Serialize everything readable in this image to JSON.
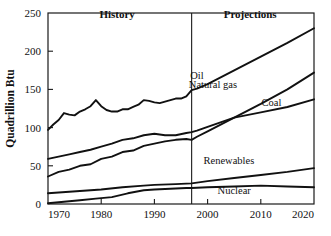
{
  "chart_data": {
    "type": "line",
    "title": "",
    "xlabel": "",
    "ylabel": "Quadrillion Btu",
    "xlim": [
      1970,
      2020
    ],
    "ylim": [
      0,
      250
    ],
    "xticks": [
      1970,
      1980,
      1990,
      2000,
      2010,
      2020
    ],
    "yticks": [
      0,
      50,
      100,
      150,
      200,
      250
    ],
    "grid": false,
    "legend_position": "inline-annotations",
    "annotations": [
      {
        "text": "History",
        "x": 1983,
        "y": 243,
        "bold": true
      },
      {
        "text": "Projections",
        "x": 2008,
        "y": 243,
        "bold": true
      }
    ],
    "divider": {
      "x": 1997,
      "label": "history-projection-divider"
    },
    "series": [
      {
        "name": "Oil",
        "label_x": 1998,
        "label_y": 163,
        "x": [
          1970,
          1971,
          1972,
          1973,
          1974,
          1975,
          1976,
          1977,
          1978,
          1979,
          1980,
          1981,
          1982,
          1983,
          1984,
          1985,
          1986,
          1987,
          1988,
          1989,
          1990,
          1991,
          1992,
          1993,
          1994,
          1995,
          1996,
          1997,
          1998,
          2000,
          2005,
          2010,
          2015,
          2020
        ],
        "values": [
          97,
          104,
          110,
          119,
          117,
          116,
          121,
          124,
          128,
          136,
          128,
          123,
          121,
          121,
          124,
          124,
          127,
          130,
          136,
          135,
          133,
          132,
          134,
          136,
          138,
          138,
          141,
          149,
          151,
          157,
          175,
          193,
          211,
          230
        ]
      },
      {
        "name": "Natural gas",
        "label_x": 2001,
        "label_y": 152,
        "x": [
          1970,
          1972,
          1974,
          1976,
          1978,
          1980,
          1982,
          1984,
          1986,
          1988,
          1990,
          1992,
          1994,
          1996,
          1997,
          1998,
          2000,
          2005,
          2010,
          2015,
          2020
        ],
        "values": [
          36,
          42,
          45,
          50,
          52,
          59,
          62,
          68,
          70,
          76,
          79,
          82,
          84,
          85,
          84,
          88,
          95,
          113,
          131,
          150,
          172
        ]
      },
      {
        "name": "Coal",
        "label_x": 2012,
        "label_y": 128,
        "x": [
          1970,
          1972,
          1974,
          1976,
          1978,
          1980,
          1982,
          1984,
          1986,
          1988,
          1990,
          1992,
          1994,
          1996,
          1997,
          1998,
          2000,
          2005,
          2010,
          2015,
          2020
        ],
        "values": [
          59,
          62,
          65,
          68,
          71,
          75,
          79,
          84,
          86,
          90,
          92,
          90,
          90,
          93,
          94,
          96,
          101,
          113,
          120,
          127,
          137
        ]
      },
      {
        "name": "Renewables",
        "label_x": 2004,
        "label_y": 52,
        "x": [
          1970,
          1974,
          1978,
          1980,
          1984,
          1988,
          1990,
          1994,
          1997,
          2000,
          2005,
          2010,
          2015,
          2020
        ],
        "values": [
          14,
          16,
          18,
          19,
          22,
          24,
          25,
          26,
          27,
          30,
          34,
          38,
          42,
          47
        ]
      },
      {
        "name": "Nuclear",
        "label_x": 2005,
        "label_y": 13,
        "x": [
          1970,
          1973,
          1976,
          1979,
          1982,
          1985,
          1988,
          1990,
          1993,
          1996,
          1997,
          2000,
          2005,
          2010,
          2015,
          2020
        ],
        "values": [
          1,
          3,
          5,
          7,
          9,
          14,
          18,
          19,
          20,
          21,
          21,
          22,
          23,
          24,
          23,
          22
        ]
      }
    ]
  }
}
